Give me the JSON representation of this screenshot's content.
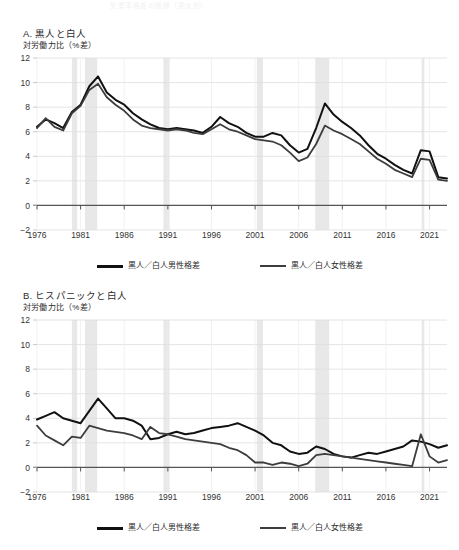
{
  "figure": {
    "top_faint_text": "失業率格差の推移（男女別）",
    "axis_year_labels": [
      "1976",
      "1981",
      "1986",
      "1991",
      "1996",
      "2001",
      "2006",
      "2011",
      "2016",
      "2021"
    ],
    "y_tick_labels": [
      "12",
      "10",
      "8",
      "6",
      "4",
      "2",
      "0",
      "-2"
    ]
  },
  "panels": [
    {
      "id": "panel-a",
      "title": "A. 黒人と白人",
      "subtitle": "対労働力比（%差）",
      "legend": [
        {
          "label": "黒人／白人男性格差",
          "color": "#111111"
        },
        {
          "label": "黒人／白人女性格差",
          "color": "#3d3d3d"
        }
      ]
    },
    {
      "id": "panel-b",
      "title": "B. ヒスパニックと白人",
      "subtitle": "対労働力比（%差）",
      "legend": [
        {
          "label": "黒人／白人男性格差",
          "color": "#111111"
        },
        {
          "label": "黒人／白人女性格差",
          "color": "#3d3d3d"
        }
      ]
    }
  ],
  "chart_data": [
    {
      "type": "line",
      "panel": "A",
      "title": "A. 黒人と白人",
      "ylabel": "対労働力比（%差）",
      "xlabel": "",
      "ylim": [
        -2,
        12
      ],
      "xlim": [
        1976,
        2023
      ],
      "yticks": [
        -2,
        0,
        2,
        4,
        6,
        8,
        10,
        12
      ],
      "xticks": [
        1976,
        1981,
        1986,
        1991,
        1996,
        2001,
        2006,
        2011,
        2016,
        2021
      ],
      "grid": true,
      "legend_position": "below",
      "recession_bands": [
        [
          1980,
          1980.6
        ],
        [
          1981.5,
          1982.9
        ],
        [
          1990.5,
          1991.2
        ],
        [
          2001.2,
          2001.9
        ],
        [
          2007.9,
          2009.5
        ],
        [
          2020.1,
          2020.4
        ]
      ],
      "x": [
        1976,
        1977,
        1978,
        1979,
        1980,
        1981,
        1982,
        1983,
        1984,
        1985,
        1986,
        1987,
        1988,
        1989,
        1990,
        1991,
        1992,
        1993,
        1994,
        1995,
        1996,
        1997,
        1998,
        1999,
        2000,
        2001,
        2002,
        2003,
        2004,
        2005,
        2006,
        2007,
        2008,
        2009,
        2010,
        2011,
        2012,
        2013,
        2014,
        2015,
        2016,
        2017,
        2018,
        2019,
        2020,
        2021,
        2022,
        2023
      ],
      "series": [
        {
          "name": "黒人／白人男性格差",
          "color": "#111111",
          "values": [
            6.4,
            7.0,
            6.7,
            6.3,
            7.6,
            8.2,
            9.7,
            10.5,
            9.2,
            8.6,
            8.2,
            7.5,
            7.0,
            6.6,
            6.3,
            6.2,
            6.3,
            6.2,
            6.1,
            5.9,
            6.4,
            7.2,
            6.7,
            6.4,
            5.9,
            5.6,
            5.6,
            5.9,
            5.7,
            4.9,
            4.3,
            4.6,
            6.3,
            8.3,
            7.4,
            6.8,
            6.3,
            5.7,
            4.9,
            4.2,
            3.8,
            3.3,
            2.9,
            2.6,
            4.5,
            4.4,
            2.3,
            2.2
          ]
        },
        {
          "name": "黒人／白人女性格差",
          "color": "#3d3d3d",
          "values": [
            6.3,
            7.1,
            6.4,
            6.1,
            7.5,
            8.1,
            9.4,
            9.9,
            8.8,
            8.2,
            7.7,
            7.0,
            6.5,
            6.3,
            6.2,
            6.1,
            6.2,
            6.1,
            5.9,
            5.8,
            6.2,
            6.6,
            6.2,
            6.0,
            5.7,
            5.4,
            5.3,
            5.2,
            4.9,
            4.3,
            3.6,
            3.9,
            5.0,
            6.5,
            6.1,
            5.8,
            5.4,
            5.0,
            4.4,
            3.8,
            3.4,
            2.9,
            2.6,
            2.3,
            3.8,
            3.7,
            2.1,
            2.0
          ]
        }
      ]
    },
    {
      "type": "line",
      "panel": "B",
      "title": "B. ヒスパニックと白人",
      "ylabel": "対労働力比（%差）",
      "xlabel": "",
      "ylim": [
        -2,
        12
      ],
      "xlim": [
        1976,
        2023
      ],
      "yticks": [
        -2,
        0,
        2,
        4,
        6,
        8,
        10,
        12
      ],
      "xticks": [
        1976,
        1981,
        1986,
        1991,
        1996,
        2001,
        2006,
        2011,
        2016,
        2021
      ],
      "grid": true,
      "legend_position": "below",
      "recession_bands": [
        [
          1980,
          1980.6
        ],
        [
          1981.5,
          1982.9
        ],
        [
          1990.5,
          1991.2
        ],
        [
          2001.2,
          2001.9
        ],
        [
          2007.9,
          2009.5
        ],
        [
          2020.1,
          2020.4
        ]
      ],
      "x": [
        1976,
        1977,
        1978,
        1979,
        1980,
        1981,
        1982,
        1983,
        1984,
        1985,
        1986,
        1987,
        1988,
        1989,
        1990,
        1991,
        1992,
        1993,
        1994,
        1995,
        1996,
        1997,
        1998,
        1999,
        2000,
        2001,
        2002,
        2003,
        2004,
        2005,
        2006,
        2007,
        2008,
        2009,
        2010,
        2011,
        2012,
        2013,
        2014,
        2015,
        2016,
        2017,
        2018,
        2019,
        2020,
        2021,
        2022,
        2023
      ],
      "series": [
        {
          "name": "黒人／白人男性格差",
          "color": "#111111",
          "values": [
            3.9,
            4.2,
            4.5,
            4.0,
            3.8,
            3.6,
            4.6,
            5.6,
            4.8,
            4.0,
            4.0,
            3.8,
            3.4,
            2.3,
            2.4,
            2.7,
            2.9,
            2.7,
            2.8,
            3.0,
            3.2,
            3.3,
            3.4,
            3.6,
            3.3,
            3.0,
            2.6,
            2.0,
            1.8,
            1.3,
            1.1,
            1.2,
            1.7,
            1.5,
            1.1,
            0.9,
            0.8,
            1.0,
            1.2,
            1.1,
            1.3,
            1.5,
            1.7,
            2.2,
            2.1,
            1.9,
            1.6,
            1.8
          ]
        },
        {
          "name": "黒人／白人女性格差",
          "color": "#3d3d3d",
          "values": [
            3.4,
            2.6,
            2.2,
            1.8,
            2.5,
            2.4,
            3.4,
            3.2,
            3.0,
            2.9,
            2.8,
            2.6,
            2.3,
            3.3,
            2.8,
            2.7,
            2.5,
            2.3,
            2.2,
            2.1,
            2.0,
            1.9,
            1.6,
            1.4,
            1.0,
            0.4,
            0.4,
            0.2,
            0.4,
            0.3,
            0.1,
            0.3,
            1.0,
            1.1,
            1.0,
            0.9,
            0.8,
            0.7,
            0.6,
            0.5,
            0.4,
            0.3,
            0.2,
            0.1,
            2.7,
            0.9,
            0.4,
            0.6
          ]
        }
      ]
    }
  ]
}
